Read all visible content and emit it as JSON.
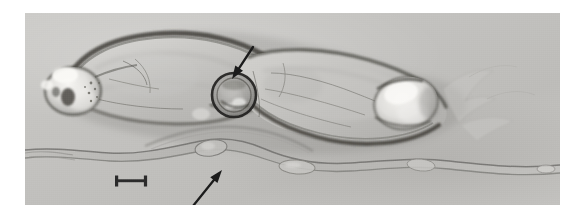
{
  "figure": {
    "domain": "Natural-Image",
    "kind": "light-micrograph",
    "background_color": "#ffffff",
    "plate": {
      "x": 25,
      "y": 13,
      "width": 535,
      "height": 192,
      "base_tone": "#c4c3c0",
      "highlight_tone": "#e8e7e4",
      "shadow_tone": "#6f6e6b",
      "darkest_tone": "#2f2e2c"
    }
  },
  "annotations": {
    "arrows": [
      {
        "id": "upper-arrow",
        "label": "arrow",
        "color": "#1b1b1b",
        "tail_x": 253,
        "tail_y": 47,
        "tip_x": 232,
        "tip_y": 79,
        "points": "down-left",
        "target": "ventral sucker / acetabulum region"
      },
      {
        "id": "lower-arrow",
        "label": "arrow",
        "color": "#1b1b1b",
        "tail_x": 193,
        "tail_y": 206,
        "tip_x": 222,
        "tip_y": 170,
        "points": "up-right",
        "target": "swelling on thread-like worm"
      }
    ],
    "scale_bar": {
      "id": "scale-bar",
      "label": "scale bar",
      "color": "#2b2b2b",
      "x": 115,
      "y": 181,
      "length_px": 32,
      "serif_height_px": 11,
      "stroke_px": 3,
      "caption": ""
    }
  },
  "structures": {
    "main_body": {
      "name": "fluke body",
      "outline_color": "#3a3936",
      "fill_light": "#d6d5d2",
      "fill_mid": "#b8b7b4"
    },
    "anterior_sucker": {
      "name": "oral sucker",
      "highlight": "#f2f1ee"
    },
    "ventral_sucker": {
      "name": "ventral sucker ring",
      "ring_color": "#2c2b29"
    },
    "posterior_bulb": {
      "name": "posterior bulb",
      "highlight": "#f0efec"
    },
    "thread_worm": {
      "name": "thread-like worm",
      "stroke_color": "#8e8d8a"
    }
  }
}
